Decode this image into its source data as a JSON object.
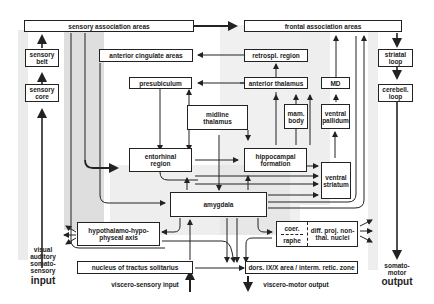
{
  "diagram": {
    "colors": {
      "line": "#222222",
      "shade": "#d9d9d9",
      "box_fill": "#ffffff"
    },
    "boxes": {
      "sensory_association": "sensory  association  areas",
      "frontal_association": "frontal  association  areas",
      "sensory_belt": "sensory\nbelt",
      "sensory_core": "sensory\ncore",
      "anterior_cingulate": "anterior cingulate areas",
      "retrosplenial": "retrospl. region",
      "presubiculum": "presubiculum",
      "anterior_thalamus": "anterior thalamus",
      "md": "MD",
      "striatal_loop": "striatal\nloop",
      "cerebell_loop": "cerebell.\nloop",
      "midline_thalamus": "midline\nthalamus",
      "mam_body": "mam.\nbody",
      "ventral_pallidum": "ventral\npallidum",
      "entorhinal": "entorhinal\nregion",
      "hippocampal": "hippocampal\nformation",
      "ventral_striatum": "ventral\nstriatum",
      "amygdala": "amygdala",
      "hypothalamo": "hypothalamo-hypo-\nphyseal axis",
      "coer": "coer.",
      "raphe": "raphe",
      "diff_proj": "diff. proj. non-\nthal. nuclei",
      "nts": "nucleus of tractus solitarius",
      "dors_area": "dors. IX/X area / interm. retic. zone"
    },
    "labels": {
      "input_modalities": "visual\nauditory\nsomato-\nsensory",
      "input": "input",
      "somato_motor": "somato-\nmotor",
      "output": "output",
      "viscero_sensory": "viscero-sensory input",
      "viscero_motor": "viscero-motor output"
    }
  }
}
